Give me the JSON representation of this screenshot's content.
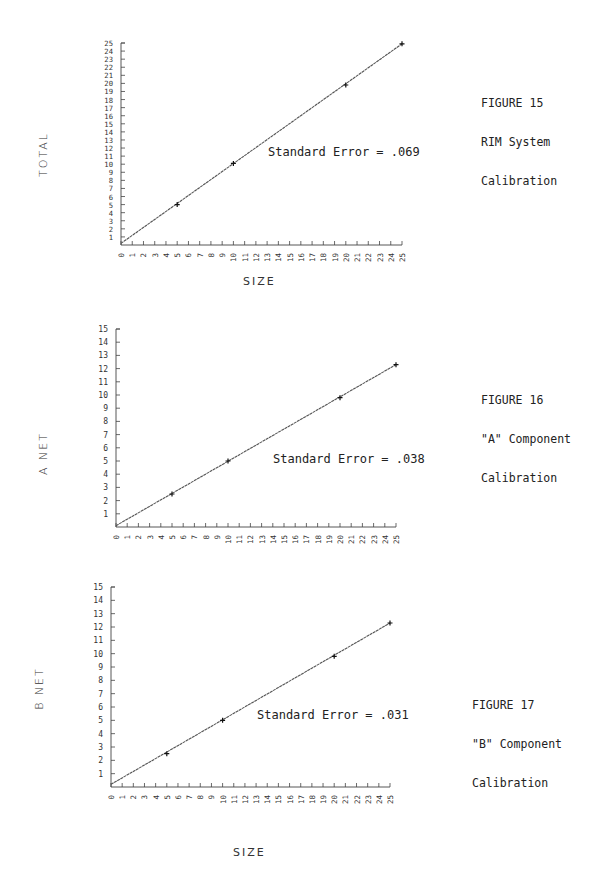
{
  "page": {
    "bottom_xlabel": "SIZE"
  },
  "chart_data": [
    {
      "type": "line",
      "figure": "FIGURE 15",
      "caption_lines": [
        "FIGURE 15",
        "RIM System",
        "Calibration"
      ],
      "title": "RIM System Calibration",
      "xlabel": "SIZE",
      "ylabel": "TOTAL",
      "annotation": "Standard Error = .069",
      "xlim": [
        0,
        25
      ],
      "ylim": [
        0,
        25
      ],
      "xticks": [
        0,
        1,
        2,
        3,
        4,
        5,
        6,
        7,
        8,
        9,
        10,
        11,
        12,
        13,
        14,
        15,
        16,
        17,
        18,
        19,
        20,
        21,
        22,
        23,
        24,
        25
      ],
      "yticks": [
        1,
        2,
        3,
        4,
        5,
        6,
        7,
        8,
        9,
        10,
        11,
        12,
        13,
        14,
        15,
        16,
        17,
        18,
        19,
        20,
        21,
        22,
        23,
        24,
        25
      ],
      "grid": false,
      "series": [
        {
          "name": "fit",
          "x": [
            0,
            25
          ],
          "y": [
            0.2,
            24.9
          ]
        },
        {
          "name": "points",
          "x": [
            5,
            10,
            20,
            25
          ],
          "y": [
            5.0,
            10.1,
            19.8,
            24.9
          ]
        }
      ]
    },
    {
      "type": "line",
      "figure": "FIGURE 16",
      "caption_lines": [
        "FIGURE 16",
        "\"A\" Component",
        "Calibration"
      ],
      "title": "\"A\" Component Calibration",
      "xlabel": "SIZE",
      "ylabel": "A NET",
      "annotation": "Standard Error = .038",
      "xlim": [
        0,
        25
      ],
      "ylim": [
        0,
        15
      ],
      "xticks": [
        0,
        1,
        2,
        3,
        4,
        5,
        6,
        7,
        8,
        9,
        10,
        11,
        12,
        13,
        14,
        15,
        16,
        17,
        18,
        19,
        20,
        21,
        22,
        23,
        24,
        25
      ],
      "yticks": [
        1,
        2,
        3,
        4,
        5,
        6,
        7,
        8,
        9,
        10,
        11,
        12,
        13,
        14,
        15
      ],
      "grid": false,
      "series": [
        {
          "name": "fit",
          "x": [
            0,
            25
          ],
          "y": [
            0.1,
            12.3
          ]
        },
        {
          "name": "points",
          "x": [
            5,
            10,
            20,
            25
          ],
          "y": [
            2.5,
            5.0,
            9.8,
            12.3
          ]
        }
      ]
    },
    {
      "type": "line",
      "figure": "FIGURE 17",
      "caption_lines": [
        "FIGURE 17",
        "\"B\" Component",
        "Calibration"
      ],
      "title": "\"B\" Component Calibration",
      "xlabel": "SIZE",
      "ylabel": "B NET",
      "annotation": "Standard Error = .031",
      "xlim": [
        0,
        25
      ],
      "ylim": [
        0,
        15
      ],
      "xticks": [
        0,
        1,
        2,
        3,
        4,
        5,
        6,
        7,
        8,
        9,
        10,
        11,
        12,
        13,
        14,
        15,
        16,
        17,
        18,
        19,
        20,
        21,
        22,
        23,
        24,
        25
      ],
      "yticks": [
        1,
        2,
        3,
        4,
        5,
        6,
        7,
        8,
        9,
        10,
        11,
        12,
        13,
        14,
        15
      ],
      "grid": false,
      "series": [
        {
          "name": "fit",
          "x": [
            0,
            25
          ],
          "y": [
            0.2,
            12.3
          ]
        },
        {
          "name": "points",
          "x": [
            5,
            10,
            20,
            25
          ],
          "y": [
            2.5,
            5.0,
            9.8,
            12.3
          ]
        }
      ]
    }
  ]
}
